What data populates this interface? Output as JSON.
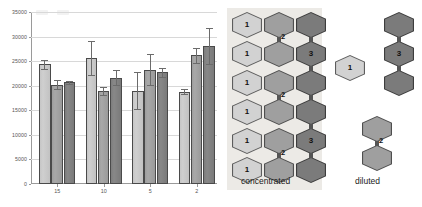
{
  "figure": {
    "width": 422,
    "height": 207,
    "background": "#ffffff"
  },
  "chart_data": {
    "type": "bar",
    "title": "",
    "subtitle": "",
    "xlabel": "",
    "ylabel": "",
    "categories": [
      "15",
      "10",
      "5",
      "2"
    ],
    "ylim": [
      0,
      35000
    ],
    "yticks": [
      0,
      5000,
      10000,
      15000,
      20000,
      25000,
      30000,
      35000
    ],
    "ytick_labels": [
      "0",
      "5000",
      "10000",
      "15000",
      "20000",
      "25000",
      "30000",
      "35000"
    ],
    "grid": true,
    "grid_axis": "y",
    "legend": "none",
    "legend_entries": [],
    "error_bars": true,
    "series": [
      {
        "name": "series-1",
        "color": "#c9c9c9",
        "values": [
          24400,
          25600,
          19000,
          18800
        ],
        "errors": [
          900,
          3500,
          3700,
          500
        ]
      },
      {
        "name": "series-2",
        "color": "#a2a2a2",
        "values": [
          20200,
          18900,
          23300,
          26200
        ],
        "errors": [
          900,
          800,
          3200,
          1500
        ]
      },
      {
        "name": "series-3",
        "color": "#808080",
        "values": [
          20700,
          21600,
          22700,
          28100
        ],
        "errors": [
          300,
          1500,
          900,
          3700
        ]
      }
    ]
  },
  "diagram": {
    "concentrated": {
      "caption": "concentrated",
      "columns": [
        {
          "name": "column-1",
          "shade": "c-light",
          "hexagons": [
            {
              "label": "1"
            },
            {
              "label": "1"
            },
            {
              "label": "1"
            },
            {
              "label": "1"
            },
            {
              "label": "1"
            },
            {
              "label": "1"
            }
          ],
          "connectors": []
        },
        {
          "name": "column-2",
          "shade": "c-mid",
          "hexagons": [
            {
              "label": ""
            },
            {
              "label": ""
            },
            {
              "label": ""
            },
            {
              "label": ""
            },
            {
              "label": ""
            },
            {
              "label": ""
            }
          ],
          "connectors": [
            {
              "after": 0,
              "label": "2"
            },
            {
              "after": 2,
              "label": "2"
            },
            {
              "after": 4,
              "label": "2"
            }
          ]
        },
        {
          "name": "column-3",
          "shade": "c-dark",
          "hexagons": [
            {
              "label": ""
            },
            {
              "label": "3"
            },
            {
              "label": ""
            },
            {
              "label": ""
            },
            {
              "label": "3"
            },
            {
              "label": ""
            }
          ],
          "connectors": [
            {
              "after": 0,
              "label": ""
            },
            {
              "after": 1,
              "label": ""
            },
            {
              "after": 2,
              "label": ""
            },
            {
              "after": 3,
              "label": ""
            },
            {
              "after": 4,
              "label": ""
            }
          ]
        }
      ]
    },
    "diluted": {
      "caption": "diluted",
      "groups": [
        {
          "name": "single-monomer",
          "shade": "c-light",
          "hexagons": [
            {
              "label": "1"
            }
          ],
          "connectors": []
        },
        {
          "name": "trimer",
          "shade": "c-dark",
          "hexagons": [
            {
              "label": ""
            },
            {
              "label": "3"
            },
            {
              "label": ""
            }
          ],
          "connectors": [
            {
              "after": 0,
              "label": ""
            },
            {
              "after": 1,
              "label": ""
            }
          ]
        },
        {
          "name": "dimer",
          "shade": "c-mid",
          "hexagons": [
            {
              "label": ""
            },
            {
              "label": ""
            }
          ],
          "connectors": [
            {
              "after": 0,
              "label": "2"
            }
          ]
        }
      ]
    }
  }
}
